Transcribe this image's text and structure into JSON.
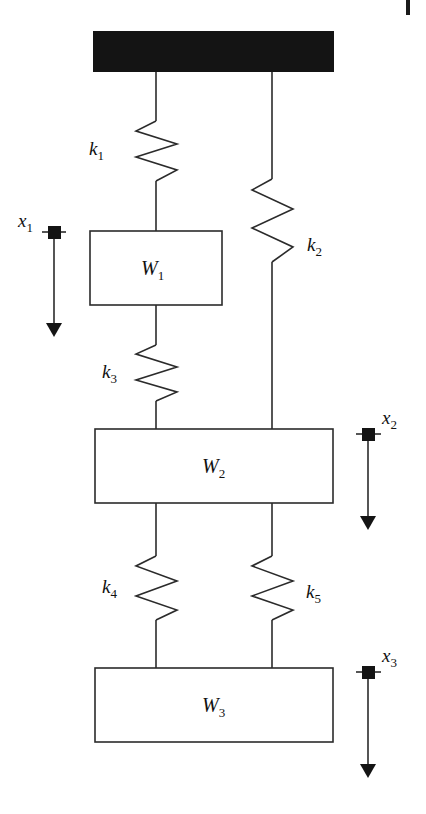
{
  "figure": {
    "type": "mechanical-schematic",
    "background_color": "#ffffff",
    "line_color": "#2b2b2b",
    "fill_color": "#ffffff",
    "ceiling_color": "#141414"
  },
  "ceiling": {
    "name": "fixed-support",
    "label": ""
  },
  "masses": [
    {
      "id": "W1",
      "label": "W",
      "subscript": "1"
    },
    {
      "id": "W2",
      "label": "W",
      "subscript": "2"
    },
    {
      "id": "W3",
      "label": "W",
      "subscript": "3"
    }
  ],
  "springs": [
    {
      "id": "k1",
      "label": "k",
      "subscript": "1",
      "connects": "ceiling-to-W1"
    },
    {
      "id": "k2",
      "label": "k",
      "subscript": "2",
      "connects": "ceiling-to-W2"
    },
    {
      "id": "k3",
      "label": "k",
      "subscript": "3",
      "connects": "W1-to-W2"
    },
    {
      "id": "k4",
      "label": "k",
      "subscript": "4",
      "connects": "W2-to-W3"
    },
    {
      "id": "k5",
      "label": "k",
      "subscript": "5",
      "connects": "W2-to-W3"
    }
  ],
  "displacements": [
    {
      "id": "x1",
      "label": "x",
      "subscript": "1",
      "direction": "down",
      "attached_to": "W1"
    },
    {
      "id": "x2",
      "label": "x",
      "subscript": "2",
      "direction": "down",
      "attached_to": "W2"
    },
    {
      "id": "x3",
      "label": "x",
      "subscript": "3",
      "direction": "down",
      "attached_to": "W3"
    }
  ],
  "page_mark": {
    "name": "page-edge-tick",
    "label": ""
  }
}
